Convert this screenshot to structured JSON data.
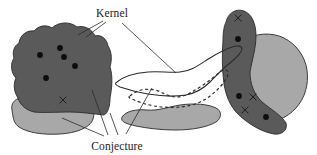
{
  "figure": {
    "background_color": "#ffffff",
    "width": 317,
    "height": 155
  },
  "labels": {
    "kernel": "Kernel",
    "conjecture": "Conjecture"
  },
  "colors": {
    "kernel_fill": "#5a5a5a",
    "conjecture_fill": "#a8a8a8",
    "outline": "#2b2b2b",
    "marker_dot": "#0d0d0d",
    "marker_cross": "#1a1a1a",
    "leader_line": "#2b2b2b",
    "background": "#ffffff"
  },
  "shapes": [
    {
      "name": "left-conjecture-region",
      "kind": "conjecture",
      "fill": "#a8a8a8",
      "path": "M 12 110 C 10 100 20 96 32 96 C 48 95 66 96 80 99 C 92 102 96 110 93 119 C 90 128 76 133 60 134 C 44 135 28 133 19 127 C 13 123 13 116 12 110 Z"
    },
    {
      "name": "left-kernel-region",
      "kind": "kernel",
      "fill": "#5a5a5a",
      "path": "M 19 43 C 20 35 27 30 34 31 C 38 26 46 24 52 28 C 58 22 70 21 77 27 C 84 25 92 29 95 36 C 101 34 107 39 108 46 C 112 52 112 60 110 67 C 113 76 112 88 110 98 C 110 106 108 113 104 115 C 94 114 82 112 70 112 C 58 112 44 113 34 112 C 26 110 20 105 18 98 C 14 92 13 84 16 78 C 11 73 10 64 14 58 C 12 52 14 46 19 43 Z"
    },
    {
      "name": "middle-conjecture-region",
      "kind": "conjecture",
      "fill": "#a8a8a8",
      "path": "M 122 117 C 126 111 136 109 147 110 C 158 111 168 107 180 105 C 194 103 208 104 216 108 C 222 111 222 118 216 122 C 208 127 192 130 176 130 C 160 130 146 128 136 126 C 127 124 120 122 122 117 Z"
    },
    {
      "name": "right-conjecture-region",
      "kind": "conjecture",
      "fill": "#a8a8a8",
      "path": "M 244 40 C 256 33 272 32 284 38 C 296 44 305 56 307 70 C 309 84 305 98 296 108 C 287 118 273 124 260 122 C 250 120 244 112 241 102 C 238 88 238 70 239 56 C 240 48 241 43 244 40 Z"
    },
    {
      "name": "right-kernel-region",
      "kind": "kernel",
      "fill": "#5a5a5a",
      "path": "M 226 22 C 228 13 236 8 244 11 C 252 14 256 24 256 36 C 256 48 252 60 250 72 C 250 84 254 94 262 102 C 272 110 282 116 286 123 C 288 130 282 135 274 134 C 262 132 248 124 238 114 C 230 106 226 96 224 84 C 222 70 222 54 223 40 C 223 32 224 26 226 22 Z"
    }
  ],
  "outlined_shapes": [
    {
      "name": "middle-solid-outline-region",
      "style": "solid",
      "path": "M 117 82 C 124 76 136 73 148 72 C 160 71 170 73 180 72 C 192 71 200 64 210 58 C 218 53 226 49 232 47 C 238 45 242 46 242 49 C 242 53 236 58 230 63 C 222 69 216 76 210 82 C 204 88 196 93 186 95 C 174 97 160 96 148 94 C 136 92 126 89 120 87 C 116 85 114 84 117 82 Z"
    },
    {
      "name": "middle-dashed-outline-region",
      "style": "dashed",
      "path": "M 130 96 C 136 90 146 88 155 90 C 163 92 168 97 176 97 C 185 97 192 92 200 87 C 208 82 215 76 220 72 C 224 69 228 69 228 73 C 228 78 223 84 217 90 C 210 97 202 102 192 105 C 180 108 166 108 154 106 C 144 104 136 101 132 99 C 129 98 128 97 130 96 Z"
    }
  ],
  "markers": {
    "dots": [
      {
        "name": "left-kernel-dot-1",
        "cx": 40,
        "cy": 55,
        "r": 2.9
      },
      {
        "name": "left-kernel-dot-2",
        "cx": 60,
        "cy": 48,
        "r": 2.9
      },
      {
        "name": "left-kernel-dot-3",
        "cx": 64,
        "cy": 57,
        "r": 2.9
      },
      {
        "name": "left-kernel-dot-4",
        "cx": 75,
        "cy": 66,
        "r": 2.9
      },
      {
        "name": "left-kernel-dot-5",
        "cx": 46,
        "cy": 78,
        "r": 2.9
      },
      {
        "name": "right-kernel-dot-1",
        "cx": 238,
        "cy": 39,
        "r": 2.9
      },
      {
        "name": "right-kernel-dot-2",
        "cx": 239,
        "cy": 96,
        "r": 2.9
      },
      {
        "name": "right-kernel-dot-3",
        "cx": 266,
        "cy": 117,
        "r": 2.9
      }
    ],
    "crosses": [
      {
        "name": "left-kernel-cross-1",
        "cx": 63,
        "cy": 100,
        "size": 3.4
      },
      {
        "name": "right-kernel-cross-1",
        "cx": 238,
        "cy": 18,
        "size": 3.4
      },
      {
        "name": "right-kernel-cross-2",
        "cx": 253,
        "cy": 97,
        "size": 3.4
      },
      {
        "name": "right-kernel-cross-3",
        "cx": 245,
        "cy": 110,
        "size": 3.4
      }
    ]
  },
  "leader_lines": {
    "kernel": [
      {
        "name": "kernel-leader-left",
        "path": "M 103 21 L 78 35"
      },
      {
        "name": "kernel-leader-left-lower",
        "path": "M 106 22 L 86 37"
      },
      {
        "name": "kernel-leader-right",
        "path": "M 122 23 L 176 73"
      }
    ],
    "conjecture": [
      {
        "name": "conjecture-leader-kernel",
        "path": "M 108 135 L 92 90"
      },
      {
        "name": "conjecture-leader-light",
        "path": "M 104 136 L 62 118"
      },
      {
        "name": "conjecture-leader-dashed",
        "path": "M 126 134 L 152 88"
      },
      {
        "name": "conjecture-leader-middle",
        "path": "M 118 135 L 110 113"
      }
    ]
  },
  "label_positions": {
    "kernel": {
      "x": 112,
      "y": 17
    },
    "conjecture": {
      "x": 117,
      "y": 150
    }
  }
}
